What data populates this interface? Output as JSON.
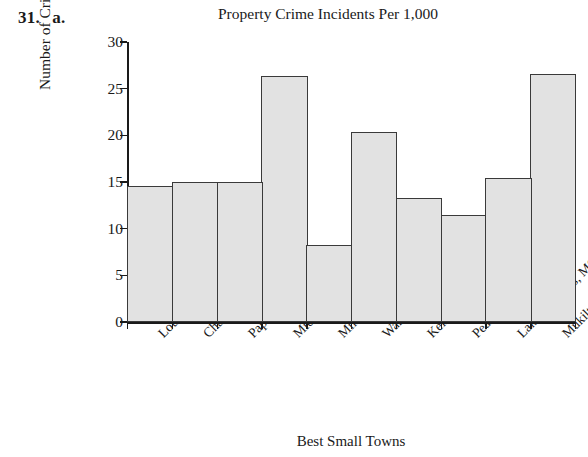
{
  "problem": {
    "number": "31.",
    "part": "a."
  },
  "clipped_text_above": "Property Crime",
  "axis_title_x": "Best Small Towns",
  "axis_title_y": "Number of Crimes",
  "colors": {
    "bar_fill": "#e2e2e2",
    "bar_stroke": "#3a3a3a",
    "axis": "#1a1a1a",
    "text": "#1a1a1a",
    "background": "#ffffff"
  },
  "chart_data": {
    "type": "bar",
    "title": "Property Crime Incidents Per 1,000",
    "xlabel": "Best Small Towns",
    "ylabel": "Number of Crimes",
    "ylim": [
      0,
      30
    ],
    "yticks": [
      0,
      5,
      10,
      15,
      20,
      25,
      30
    ],
    "ytick_labels": [
      "0",
      "5",
      "10",
      "15",
      "20",
      "25",
      "30"
    ],
    "grid": false,
    "legend": false,
    "bar_gap": 0,
    "categories": [
      "Louisville, CO",
      "Chanhassen, MN",
      "Papillion, NE",
      "Middleton, WI",
      "Milton, MA",
      "Warren, NJ",
      "Keller, TX",
      "Peachtree City, GA",
      "Lake St. Louis, MO",
      "Mukilteo, WA"
    ],
    "values": [
      14.6,
      15.0,
      15.0,
      26.4,
      8.3,
      20.4,
      13.3,
      11.5,
      15.4,
      26.6
    ]
  }
}
